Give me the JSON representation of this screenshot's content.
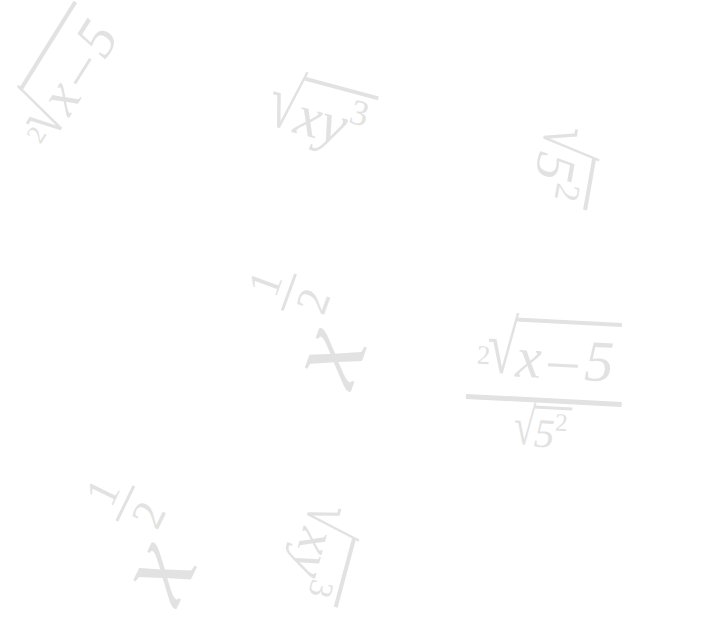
{
  "page": {
    "background_color": "#ffffff",
    "ink_color": "#e2e2e2",
    "width": 717,
    "height": 628
  },
  "expressions": [
    {
      "id": "top-left-radical",
      "plain": "2-root of (x - 5)",
      "index": "2",
      "radical_sign": "√",
      "radicand_var": "x",
      "operator": "–",
      "operand": "5",
      "rotation_deg": -58
    },
    {
      "id": "top-middle-radical",
      "plain": "square root of x y cubed",
      "radical_sign": "√",
      "var_x": "x",
      "var_y": "y",
      "exponent": "3",
      "rotation_deg": 15
    },
    {
      "id": "top-right-radical",
      "plain": "square root of 5 squared",
      "radical_sign": "√",
      "base": "5",
      "exponent": "2",
      "rotation_deg": 100
    },
    {
      "id": "center-power",
      "plain": "x to the one half",
      "base": "x",
      "numerator": "1",
      "denominator": "2",
      "rotation_deg": -70
    },
    {
      "id": "lower-left-power",
      "plain": "x to the one half",
      "base": "x",
      "numerator": "1",
      "denominator": "2",
      "rotation_deg": -64
    },
    {
      "id": "bottom-middle-radical",
      "plain": "square root of x y cubed",
      "radical_sign": "√",
      "var_x": "x",
      "var_y": "y",
      "exponent": "3",
      "rotation_deg": 105
    },
    {
      "id": "right-fraction",
      "plain": "2-root of (x - 5) over square root of 5 squared",
      "numerator": {
        "index": "2",
        "radical_sign": "√",
        "radicand_var": "x",
        "operator": "–",
        "operand": "5"
      },
      "denominator": {
        "radical_sign": "√",
        "base": "5",
        "exponent": "2"
      },
      "rotation_deg": 3
    }
  ],
  "glyphs": {
    "radical": "√",
    "minus": "–",
    "x": "x",
    "y": "y",
    "five": "5",
    "two": "2",
    "three": "3",
    "one": "1"
  }
}
